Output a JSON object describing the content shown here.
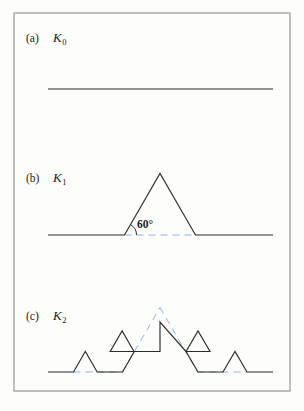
{
  "figure": {
    "kind": "koch-curve-construction",
    "frame": {
      "x": 14,
      "y": 13,
      "width": 276,
      "height": 378,
      "stroke": "#8b8b8b",
      "stroke_width": 1.1
    },
    "colors": {
      "curve": "#2b2b2b",
      "guide": "#8fb4d9",
      "frame": "#8b8b8b",
      "text": "#1b1b1b",
      "background": "#fdfdfc"
    },
    "stroke_width_curve": 1.15,
    "stroke_width_guide": 1.0,
    "guide_dash": "7,5"
  },
  "panels": [
    {
      "id": "panel-a",
      "tag": "(a)",
      "symbol": "K",
      "subscript": "0",
      "tag_x": 26,
      "tag_y": 42,
      "sym_x": 53,
      "sym_y": 42,
      "baseline_y": 89,
      "x_left": 48,
      "x_right": 273,
      "curve_points": "48,89 273,89",
      "guide_points": ""
    },
    {
      "id": "panel-b",
      "tag": "(b)",
      "symbol": "K",
      "subscript": "1",
      "tag_x": 26,
      "tag_y": 182,
      "sym_x": 53,
      "sym_y": 182,
      "baseline_y": 235,
      "x_left": 48,
      "x_right": 273,
      "curve_points": "48,235 124.5,235 160,173.5 195.5,235 273,235",
      "guide_points": "124.5,235 195.5,235",
      "angle": {
        "label": "60°",
        "text_x": 137,
        "text_y": 228,
        "arc_path": "M 136.5,235 A 12,12 0 0 0 130.5,224.6",
        "vertex_x": 124.5,
        "vertex_y": 235
      }
    },
    {
      "id": "panel-c",
      "tag": "(c)",
      "symbol": "K",
      "subscript": "2",
      "tag_x": 26,
      "tag_y": 320,
      "sym_x": 53,
      "sym_y": 320,
      "baseline_y": 372,
      "x_left": 48,
      "x_right": 273,
      "curve_points": "48,372 73.5,372 85.3,351.5 97.2,372 122.5,372 134.3,351.5 110.2,351.5 122.1,331 134,351.5 160,351.5 160,322 186,351.5 198,331 210,351.5 186,351.5 198,372 223,372 235,351.5 247,372 273,372",
      "guide_points": "73.5,372 122.5,372 160,307 198,372 247,372",
      "guide_segments": [
        "73.5,372 122.5,372",
        "122.5,372 160,307.5",
        "160,307.5 197.5,372",
        "197.5,372 247,372"
      ]
    }
  ],
  "notes": {
    "geometry_description": "Koch snowflake curve generator stages K0 (straight segment), K1 (segment with equilateral bump, 60 degree angle marked), K2 (second iteration)",
    "angle_value": "60°"
  }
}
